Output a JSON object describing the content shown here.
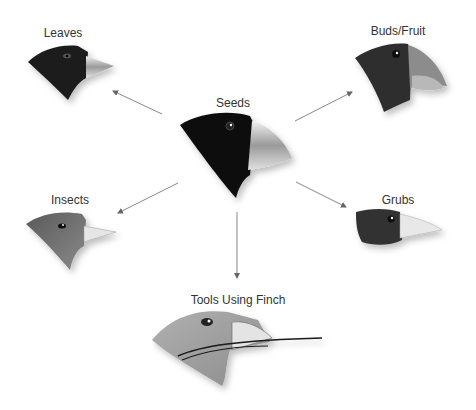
{
  "diagram": {
    "center": {
      "id": "seeds",
      "label": "Seeds"
    },
    "nodes": [
      {
        "id": "leaves",
        "label": "Leaves"
      },
      {
        "id": "buds-fruit",
        "label": "Buds/Fruit"
      },
      {
        "id": "insects",
        "label": "Insects"
      },
      {
        "id": "grubs",
        "label": "Grubs"
      },
      {
        "id": "tools-using-finch",
        "label": "Tools Using Finch"
      }
    ],
    "edges": [
      {
        "from": "seeds",
        "to": "leaves"
      },
      {
        "from": "seeds",
        "to": "buds-fruit"
      },
      {
        "from": "seeds",
        "to": "insects"
      },
      {
        "from": "seeds",
        "to": "grubs"
      },
      {
        "from": "seeds",
        "to": "tools-using-finch"
      }
    ]
  },
  "colors": {
    "arrow": "#888888",
    "head_dark": "#1a1a1a",
    "head_mid": "#3a3a3a",
    "head_gray": "#6a6a6a",
    "head_light": "#a8a8a8",
    "beak": "#d8d8d8"
  }
}
